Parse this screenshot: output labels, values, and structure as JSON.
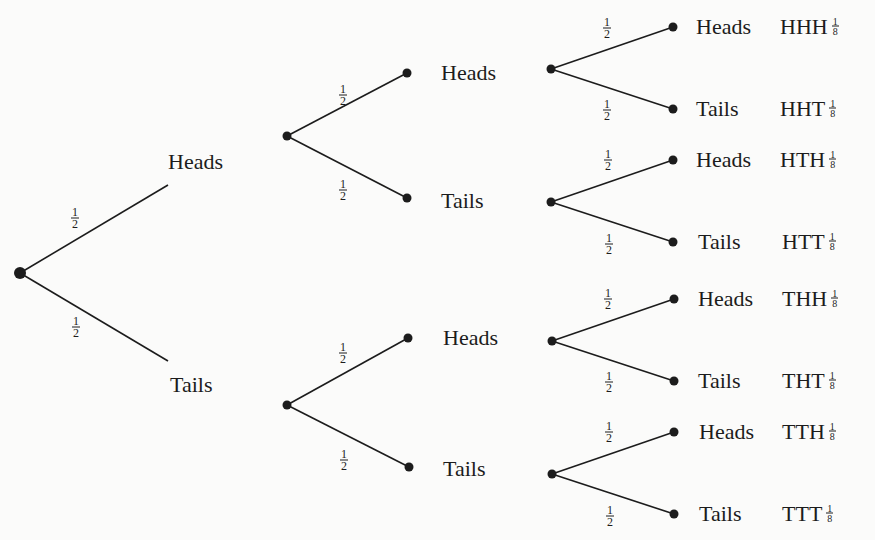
{
  "diagram": {
    "title": "",
    "type": "probability tree",
    "root": {
      "x": 20,
      "y": 273
    },
    "level1": [
      {
        "label": "Heads",
        "prob_num": "1",
        "prob_den": "2",
        "line_end": [
          168,
          185
        ],
        "label_pos": [
          168,
          162
        ],
        "prob_pos": [
          75,
          218
        ]
      },
      {
        "label": "Tails",
        "prob_num": "1",
        "prob_den": "2",
        "line_end": [
          168,
          361
        ],
        "label_pos": [
          170,
          385
        ],
        "prob_pos": [
          76,
          327
        ]
      }
    ],
    "level1_nodes": [
      {
        "x": 287,
        "y": 136
      },
      {
        "x": 287,
        "y": 405
      }
    ],
    "level2": [
      {
        "label": "Heads",
        "dot": [
          407,
          73
        ],
        "label_pos": [
          441,
          73
        ],
        "prob_num": "1",
        "prob_den": "2",
        "prob_pos": [
          343,
          95
        ]
      },
      {
        "label": "Tails",
        "dot": [
          407,
          198
        ],
        "label_pos": [
          441,
          201
        ],
        "prob_num": "1",
        "prob_den": "2",
        "prob_pos": [
          343,
          190
        ]
      },
      {
        "label": "Heads",
        "dot": [
          408,
          338
        ],
        "label_pos": [
          443,
          338
        ],
        "prob_num": "1",
        "prob_den": "2",
        "prob_pos": [
          343,
          353
        ]
      },
      {
        "label": "Tails",
        "dot": [
          409,
          467
        ],
        "label_pos": [
          443,
          469
        ],
        "prob_num": "1",
        "prob_den": "2",
        "prob_pos": [
          344,
          460
        ]
      }
    ],
    "level2_nodes": [
      {
        "x": 551,
        "y": 69
      },
      {
        "x": 551,
        "y": 202
      },
      {
        "x": 552,
        "y": 341
      },
      {
        "x": 552,
        "y": 474
      }
    ],
    "leaves": [
      {
        "label": "Heads",
        "outcome": "HHH",
        "prob_num": "1",
        "prob_den": "8",
        "dot": [
          673,
          27
        ],
        "branch_prob_pos": [
          607,
          28
        ],
        "label_x": 696,
        "outcome_x": 780
      },
      {
        "label": "Tails",
        "outcome": "HHT",
        "prob_num": "1",
        "prob_den": "8",
        "dot": [
          673,
          109
        ],
        "branch_prob_pos": [
          607,
          110
        ],
        "label_x": 696,
        "outcome_x": 780
      },
      {
        "label": "Heads",
        "outcome": "HTH",
        "prob_num": "1",
        "prob_den": "8",
        "dot": [
          673,
          160
        ],
        "branch_prob_pos": [
          608,
          160
        ],
        "label_x": 696,
        "outcome_x": 780
      },
      {
        "label": "Tails",
        "outcome": "HTT",
        "prob_num": "1",
        "prob_den": "8",
        "dot": [
          673,
          242
        ],
        "branch_prob_pos": [
          609,
          244
        ],
        "label_x": 698,
        "outcome_x": 782
      },
      {
        "label": "Heads",
        "outcome": "THH",
        "prob_num": "1",
        "prob_den": "8",
        "dot": [
          674,
          299
        ],
        "branch_prob_pos": [
          608,
          299
        ],
        "label_x": 698,
        "outcome_x": 782
      },
      {
        "label": "Tails",
        "outcome": "THT",
        "prob_num": "1",
        "prob_den": "8",
        "dot": [
          674,
          381
        ],
        "branch_prob_pos": [
          609,
          382
        ],
        "label_x": 698,
        "outcome_x": 782
      },
      {
        "label": "Heads",
        "outcome": "TTH",
        "prob_num": "1",
        "prob_den": "8",
        "dot": [
          674,
          432
        ],
        "branch_prob_pos": [
          609,
          432
        ],
        "label_x": 699,
        "outcome_x": 782
      },
      {
        "label": "Tails",
        "outcome": "TTT",
        "prob_num": "1",
        "prob_den": "8",
        "dot": [
          674,
          514
        ],
        "branch_prob_pos": [
          610,
          516
        ],
        "label_x": 699,
        "outcome_x": 782
      }
    ],
    "colors": {
      "ink": "#1c1c1c",
      "paper": "#fbfbfa"
    }
  }
}
